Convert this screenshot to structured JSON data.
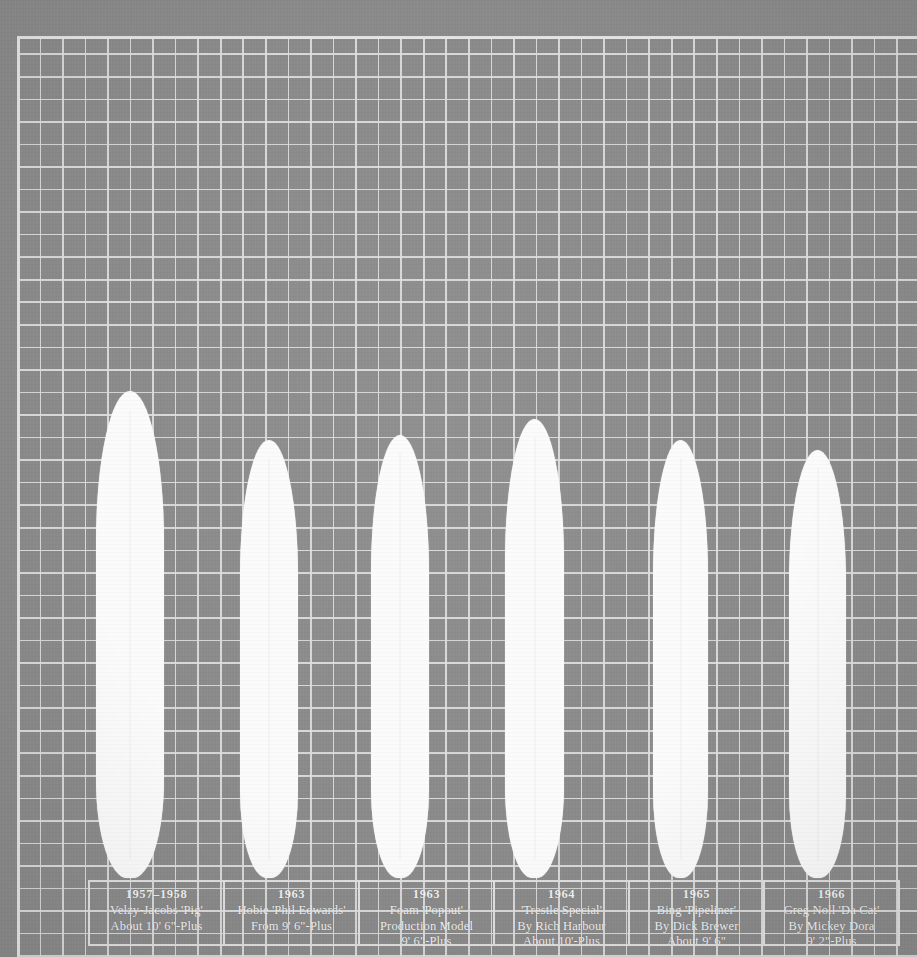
{
  "meta": {
    "background_color": "#8a8a8a",
    "grid_line_color": "#dedede",
    "board_color": "#fbfbfb",
    "label_text_color": "#f2f2f2"
  },
  "chart_data": {
    "type": "bar",
    "title": "",
    "xlabel": "",
    "ylabel": "",
    "grid": true,
    "legend": "none",
    "orientation": "vertical",
    "note": "Scale silhouettes of six vintage surfboards drawn on graph paper; bar length encodes board length.",
    "categories": [
      "1957–1958",
      "1963",
      "1963",
      "1964",
      "1965",
      "1966"
    ],
    "values": [
      10.5,
      9.5,
      9.5,
      10.0,
      9.5,
      9.17
    ],
    "value_unit": "feet",
    "series": [
      {
        "name": "Board length (ft)",
        "values": [
          10.5,
          9.5,
          9.5,
          10.0,
          9.5,
          9.17
        ]
      }
    ]
  },
  "boards": [
    {
      "id": "board-1",
      "year": "1957–1958",
      "line2": "Velzy-Jacobs 'Pig'",
      "line3": "About 10' 6\"-Plus",
      "line4": "",
      "left": 96,
      "top": 391,
      "width": 68,
      "height": 487
    },
    {
      "id": "board-2",
      "year": "1963",
      "line2": "Hobie 'Phil Edwards'",
      "line3": "From 9' 6\"-Plus",
      "line4": "",
      "left": 240,
      "top": 440,
      "width": 58,
      "height": 438
    },
    {
      "id": "board-3",
      "year": "1963",
      "line2": "Foam 'Popout'",
      "line3": "Production Model",
      "line4": "9' 6\"-Plus",
      "left": 371,
      "top": 435,
      "width": 58,
      "height": 443
    },
    {
      "id": "board-4",
      "year": "1964",
      "line2": "'Trestle Special'",
      "line3": "By Rich Harbour",
      "line4": "About 10'-Plus",
      "left": 505,
      "top": 419,
      "width": 59,
      "height": 459
    },
    {
      "id": "board-5",
      "year": "1965",
      "line2": "Bing 'Pipeliner'",
      "line3": "By Dick Brewer",
      "line4": "About 9' 6\"",
      "left": 653,
      "top": 440,
      "width": 55,
      "height": 438
    },
    {
      "id": "board-6",
      "year": "1966",
      "line2": "Greg Noll 'Da Cat'",
      "line3": "By Mickey Dora",
      "line4": "9' 2\"-Plus",
      "left": 789,
      "top": 450,
      "width": 57,
      "height": 428
    }
  ]
}
